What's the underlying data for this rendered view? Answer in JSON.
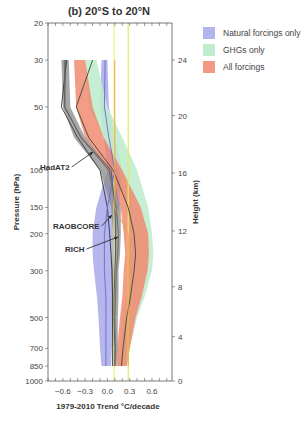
{
  "chart_data": {
    "type": "area",
    "title": "(b) 20°S to 20°N",
    "xlabel": "1979-2010 Trend °C/decade",
    "ylabel": "Pressure (hPa)",
    "ylabel_right": "Height (km)",
    "xlim": [
      -0.8,
      0.87
    ],
    "ylim_pressure": [
      1000,
      20
    ],
    "y_scale": "log",
    "x_ticks": [
      -0.6,
      -0.3,
      0.0,
      0.3,
      0.6
    ],
    "x_tick_labels": [
      "−0.6",
      "−0.3",
      "0.0",
      "0.3",
      "0.6"
    ],
    "y_ticks": [
      20,
      30,
      50,
      100,
      150,
      200,
      300,
      500,
      700,
      850,
      1000
    ],
    "y_tick_labels": [
      "20",
      "30",
      "50",
      "100",
      "150",
      "200",
      "300",
      "500",
      "700",
      "850",
      "1000"
    ],
    "height_ticks": [
      {
        "km": 0,
        "p": 1000
      },
      {
        "km": 4,
        "p": 616
      },
      {
        "km": 8,
        "p": 357
      },
      {
        "km": 12,
        "p": 194
      },
      {
        "km": 16,
        "p": 103
      },
      {
        "km": 20,
        "p": 55
      },
      {
        "km": 24,
        "p": 30
      }
    ],
    "legend": [
      {
        "label": "Natural forcings only",
        "color": "#b5b5ee"
      },
      {
        "label": "GHGs only",
        "color": "#bfeccd"
      },
      {
        "label": "All forcings",
        "color": "#f29a86"
      }
    ],
    "pressure_levels": [
      30,
      50,
      70,
      100,
      150,
      200,
      250,
      300,
      400,
      500,
      700,
      850
    ],
    "series": [
      {
        "name": "Natural forcings only",
        "color": "#a9a9ea",
        "opacity": 0.85,
        "low": [
          -0.08,
          -0.1,
          -0.05,
          0.0,
          -0.15,
          -0.2,
          -0.2,
          -0.18,
          -0.14,
          -0.12,
          -0.1,
          -0.08
        ],
        "high": [
          0.0,
          0.02,
          0.1,
          0.2,
          0.15,
          0.12,
          0.12,
          0.1,
          0.1,
          0.08,
          0.06,
          0.05
        ],
        "mid": [
          -0.04,
          -0.04,
          0.02,
          0.1,
          0.02,
          -0.04,
          -0.04,
          -0.04,
          -0.02,
          -0.02,
          -0.02,
          -0.02
        ]
      },
      {
        "name": "GHGs only",
        "color": "#bfeccd",
        "opacity": 0.9,
        "low": [
          -0.3,
          -0.25,
          -0.05,
          0.15,
          0.25,
          0.3,
          0.3,
          0.28,
          0.25,
          0.2,
          0.16,
          0.14
        ],
        "high": [
          -0.15,
          0.0,
          0.2,
          0.4,
          0.55,
          0.6,
          0.62,
          0.6,
          0.5,
          0.4,
          0.3,
          0.26
        ],
        "mid": [
          -0.23,
          -0.12,
          0.08,
          0.28,
          0.4,
          0.45,
          0.46,
          0.44,
          0.38,
          0.3,
          0.23,
          0.2
        ]
      },
      {
        "name": "All forcings",
        "color": "#f0836a",
        "opacity": 0.8,
        "low": [
          -0.45,
          -0.42,
          -0.3,
          0.0,
          0.18,
          0.22,
          0.24,
          0.22,
          0.2,
          0.17,
          0.13,
          0.12
        ],
        "high": [
          -0.3,
          -0.2,
          -0.05,
          0.2,
          0.45,
          0.55,
          0.56,
          0.54,
          0.46,
          0.38,
          0.3,
          0.26
        ],
        "mid": [
          -0.38,
          -0.31,
          -0.18,
          0.1,
          0.31,
          0.38,
          0.4,
          0.38,
          0.33,
          0.27,
          0.21,
          0.19
        ]
      },
      {
        "name": "Observations spread",
        "color": "#8a8a8a",
        "opacity": 0.75,
        "low": [
          -0.62,
          -0.6,
          -0.45,
          -0.1,
          0.05,
          0.08,
          0.08,
          0.06,
          0.06,
          0.06,
          0.08,
          0.08
        ],
        "high": [
          -0.52,
          -0.5,
          -0.3,
          0.05,
          0.18,
          0.18,
          0.17,
          0.15,
          0.15,
          0.14,
          0.14,
          0.12
        ],
        "mid": [
          -0.57,
          -0.55,
          -0.37,
          -0.02,
          0.11,
          0.13,
          0.12,
          0.1,
          0.1,
          0.1,
          0.11,
          0.1
        ]
      }
    ],
    "lines": [
      {
        "name": "HadAT2",
        "color": "#333333",
        "x": [
          -0.55,
          -0.62,
          -0.4,
          -0.1,
          0.0,
          0.03,
          0.05,
          0.06,
          0.07,
          0.07,
          0.07,
          0.07
        ]
      },
      {
        "name": "RAOBCORE",
        "color": "#555555",
        "x": [
          -0.56,
          -0.58,
          -0.35,
          0.05,
          0.1,
          0.11,
          0.11,
          0.1,
          0.09,
          0.09,
          0.1,
          0.1
        ]
      },
      {
        "name": "RICH",
        "color": "#666666",
        "x": [
          -0.58,
          -0.57,
          -0.36,
          0.02,
          0.12,
          0.15,
          0.14,
          0.12,
          0.11,
          0.1,
          0.11,
          0.1
        ]
      },
      {
        "name": "All forcings central",
        "color": "#3a4a30",
        "x": [
          -0.2,
          -0.42,
          -0.25,
          0.08,
          0.28,
          0.36,
          0.38,
          0.36,
          0.31,
          0.26,
          0.21,
          0.19
        ]
      },
      {
        "name": "Natural central",
        "color": "#6a6ad0",
        "x": [
          -0.03,
          -0.04,
          0.02,
          0.1,
          0.0,
          -0.04,
          -0.04,
          -0.04,
          -0.02,
          -0.02,
          -0.02,
          -0.02
        ]
      },
      {
        "name": "All forcings satellite",
        "color": "#e8a23a",
        "x": [
          0.1,
          0.1,
          0.1,
          0.1,
          0.1,
          0.28,
          0.28,
          0.28,
          0.28,
          0.28,
          0.28,
          0.28
        ]
      }
    ],
    "vertical_lines": [
      {
        "x": 0.09,
        "color": "#eef07a"
      },
      {
        "x": 0.28,
        "color": "#e6e860"
      }
    ],
    "annotations": [
      {
        "label": "HadAT2",
        "text_x": 40,
        "text_y": 170,
        "arrow_to_x": 93,
        "arrow_to_y": 152
      },
      {
        "label": "RAOBCORE",
        "text_x": 53,
        "text_y": 229,
        "arrow_to_x": 112,
        "arrow_to_y": 215
      },
      {
        "label": "RICH",
        "text_x": 65,
        "text_y": 252,
        "arrow_to_x": 118,
        "arrow_to_y": 237
      }
    ]
  }
}
